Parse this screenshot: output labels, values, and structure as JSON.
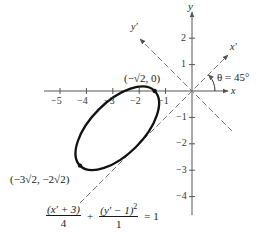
{
  "figure": {
    "axes": {
      "x_label": "x",
      "y_label": "y",
      "x_rot_label": "x′",
      "y_rot_label": "y′",
      "x_ticks": [
        "−5",
        "−4",
        "−3",
        "−2",
        "−1"
      ],
      "y_ticks": [
        "2",
        "1",
        "−1",
        "−2",
        "−3",
        "−4"
      ]
    },
    "angle_label": "θ = 45°",
    "points": {
      "vertex_top": "(−√2, 0)",
      "vertex_bottom": "(−3√2, −2√2)"
    },
    "equation": {
      "term1_num": "(x′ + 3)",
      "term1_den": "4",
      "plus": "+",
      "term2_num": "(y′ − 1)",
      "term2_exp": "2",
      "term2_den": "1",
      "rhs": "= 1"
    },
    "colors": {
      "curve": "#111111",
      "axes": "#555555",
      "rotated_axes": "#777777"
    }
  }
}
